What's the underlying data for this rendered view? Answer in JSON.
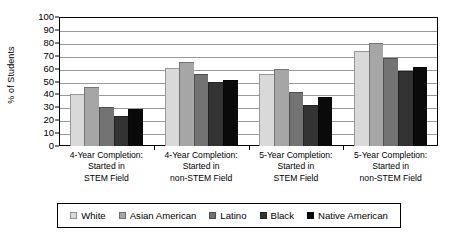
{
  "chart_data": {
    "type": "bar",
    "title": "",
    "subtitle": "",
    "xlabel": "",
    "ylabel": "% of Students",
    "ylim": [
      0,
      100
    ],
    "ytick_step": 10,
    "ytick_labels": [
      "100",
      "90",
      "80",
      "70",
      "60",
      "50",
      "40",
      "30",
      "20",
      "10",
      "0"
    ],
    "ytick_values": [
      100,
      90,
      80,
      70,
      60,
      50,
      40,
      30,
      20,
      10,
      0
    ],
    "grid": "horizontal",
    "legend_position": "bottom",
    "categories": [
      "4-Year Completion: Started in STEM Field",
      "4-Year Completion: Started in non-STEM Field",
      "5-Year Completion: Started in STEM Field",
      "5-Year Completion: Started in non-STEM Field"
    ],
    "category_lines": [
      [
        "4-Year Completion:",
        "Started in",
        "STEM Field"
      ],
      [
        "4-Year Completion:",
        "Started in",
        "non-STEM Field"
      ],
      [
        "5-Year Completion:",
        "Started in",
        "STEM Field"
      ],
      [
        "5-Year Completion:",
        "Started in",
        "non-STEM Field"
      ]
    ],
    "series": [
      {
        "name": "White",
        "color": "#d9d9d9",
        "values": [
          40.5,
          60.5,
          55.5,
          73.5
        ]
      },
      {
        "name": "Asian American",
        "color": "#a6a6a6",
        "values": [
          46.0,
          65.5,
          60.0,
          79.5
        ]
      },
      {
        "name": "Latino",
        "color": "#737373",
        "values": [
          30.0,
          56.0,
          41.5,
          68.0
        ]
      },
      {
        "name": "Black",
        "color": "#333333",
        "values": [
          23.0,
          49.5,
          32.0,
          58.5
        ]
      },
      {
        "name": "Native American",
        "color": "#0a0a0a",
        "values": [
          28.5,
          51.5,
          38.0,
          61.0
        ]
      }
    ]
  },
  "axis": {
    "y_title": "% of Students"
  },
  "legend": {
    "items": [
      {
        "label": "White",
        "color": "#d9d9d9"
      },
      {
        "label": "Asian American",
        "color": "#a6a6a6"
      },
      {
        "label": "Latino",
        "color": "#737373"
      },
      {
        "label": "Black",
        "color": "#333333"
      },
      {
        "label": "Native American",
        "color": "#0a0a0a"
      }
    ]
  }
}
